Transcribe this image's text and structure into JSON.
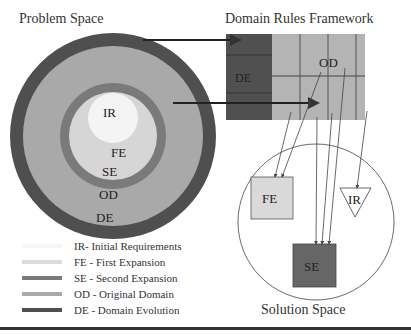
{
  "titles": {
    "problem_space": "Problem Space",
    "domain_rules_framework": "Domain Rules Framework",
    "solution_space": "Solution Space"
  },
  "rings": [
    {
      "id": "DE",
      "label": "DE",
      "color": "#4f4f4f"
    },
    {
      "id": "OD",
      "label": "OD",
      "color": "#a9a9a9"
    },
    {
      "id": "SE",
      "label": "SE",
      "color": "#7a7a7a"
    },
    {
      "id": "FE",
      "label": "FE",
      "color": "#d6d6d6"
    },
    {
      "id": "IR",
      "label": "IR",
      "color": "#f4f4f4"
    }
  ],
  "framework": {
    "de_label": "DE",
    "od_label": "OD",
    "de_color": "#505050",
    "od_color": "#b4b4b4"
  },
  "solution": {
    "fe_label": "FE",
    "se_label": "SE",
    "ir_label": "IR",
    "fe_color": "#d9d9d9",
    "se_color": "#666666"
  },
  "legend": [
    {
      "text": "IR- Initial Requirements",
      "color": "#f6f6f6"
    },
    {
      "text": "FE - First Expansion",
      "color": "#dcdcdc"
    },
    {
      "text": "SE - Second Expansion",
      "color": "#7a7a7a"
    },
    {
      "text": "OD - Original Domain",
      "color": "#aaaaaa"
    },
    {
      "text": "DE - Domain Evolution",
      "color": "#4f4f4f"
    }
  ]
}
